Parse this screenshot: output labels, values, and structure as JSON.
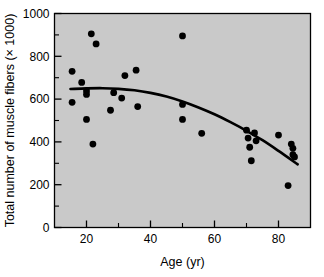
{
  "chart_data": {
    "type": "scatter",
    "title": "",
    "xlabel": "Age (yr)",
    "ylabel": "Total number of muscle fibers (× 1000)",
    "xlim": [
      10,
      90
    ],
    "ylim": [
      0,
      1000
    ],
    "x_ticks_major": [
      20,
      40,
      60,
      80
    ],
    "x_ticks_minor": [
      10,
      30,
      50,
      70,
      90
    ],
    "x_tick_labels": [
      "20",
      "40",
      "60",
      "80"
    ],
    "y_ticks_major": [
      0,
      200,
      400,
      600,
      800,
      1000
    ],
    "y_ticks_minor": [
      100,
      300,
      500,
      700,
      900
    ],
    "y_tick_labels": [
      "0",
      "200",
      "400",
      "600",
      "800",
      "1000"
    ],
    "grid": false,
    "legend": "none",
    "plot_background_color": "#c9c9c9",
    "marker_color": "#000000",
    "marker_shape": "circle",
    "trend_line_color": "#000000",
    "points": [
      {
        "x": 15.5,
        "y": 730
      },
      {
        "x": 15.5,
        "y": 585
      },
      {
        "x": 18.5,
        "y": 678
      },
      {
        "x": 20.0,
        "y": 638
      },
      {
        "x": 20.0,
        "y": 622
      },
      {
        "x": 20.0,
        "y": 505
      },
      {
        "x": 21.5,
        "y": 905
      },
      {
        "x": 22.0,
        "y": 390
      },
      {
        "x": 23.0,
        "y": 858
      },
      {
        "x": 27.5,
        "y": 548
      },
      {
        "x": 28.5,
        "y": 630
      },
      {
        "x": 31.0,
        "y": 605
      },
      {
        "x": 32.0,
        "y": 710
      },
      {
        "x": 35.5,
        "y": 735
      },
      {
        "x": 36.0,
        "y": 565
      },
      {
        "x": 50.0,
        "y": 895
      },
      {
        "x": 50.0,
        "y": 575
      },
      {
        "x": 50.0,
        "y": 505
      },
      {
        "x": 56.0,
        "y": 440
      },
      {
        "x": 70.0,
        "y": 455
      },
      {
        "x": 70.5,
        "y": 418
      },
      {
        "x": 71.0,
        "y": 375
      },
      {
        "x": 71.5,
        "y": 312
      },
      {
        "x": 72.5,
        "y": 442
      },
      {
        "x": 73.0,
        "y": 405
      },
      {
        "x": 80.0,
        "y": 432
      },
      {
        "x": 83.0,
        "y": 196
      },
      {
        "x": 84.0,
        "y": 390
      },
      {
        "x": 84.5,
        "y": 370
      },
      {
        "x": 84.5,
        "y": 340
      },
      {
        "x": 85.0,
        "y": 330
      }
    ],
    "trend_line": [
      {
        "x": 15.0,
        "y": 647
      },
      {
        "x": 20.0,
        "y": 650
      },
      {
        "x": 25.0,
        "y": 651
      },
      {
        "x": 30.0,
        "y": 648
      },
      {
        "x": 35.0,
        "y": 641
      },
      {
        "x": 40.0,
        "y": 629
      },
      {
        "x": 45.0,
        "y": 612
      },
      {
        "x": 50.0,
        "y": 589
      },
      {
        "x": 55.0,
        "y": 561
      },
      {
        "x": 60.0,
        "y": 529
      },
      {
        "x": 65.0,
        "y": 492
      },
      {
        "x": 70.0,
        "y": 452
      },
      {
        "x": 75.0,
        "y": 408
      },
      {
        "x": 80.0,
        "y": 358
      },
      {
        "x": 86.0,
        "y": 295
      }
    ]
  }
}
